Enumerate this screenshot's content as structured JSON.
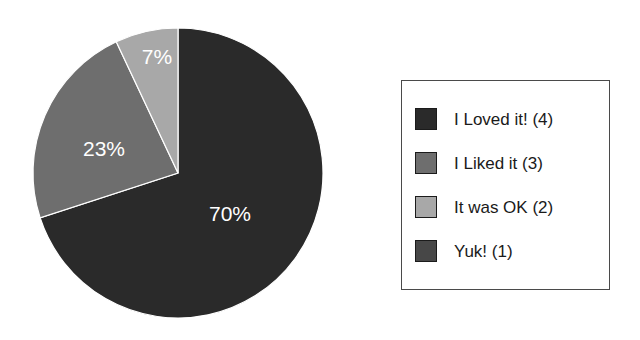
{
  "chart_data": {
    "type": "pie",
    "title": "",
    "categories": [
      "I Loved it! (4)",
      "I Liked it (3)",
      "It was OK (2)",
      "Yuk! (1)"
    ],
    "values": [
      70,
      23,
      7,
      0
    ],
    "value_labels": [
      "70%",
      "23%",
      "7%",
      ""
    ],
    "counts": [
      4,
      3,
      2,
      1
    ],
    "units": "percent",
    "start_angle_deg": 0,
    "direction": "clockwise",
    "legend_position": "right",
    "grid": false,
    "colors": [
      "#2a2a2a",
      "#6e6e6e",
      "#a8a8a8",
      "#474747"
    ],
    "label_color": "#ffffff",
    "background": "#ffffff"
  },
  "pie": {
    "slices": [
      {
        "label": "70%",
        "percent": 70,
        "color": "#2a2a2a",
        "label_x": 230,
        "label_y": 215
      },
      {
        "label": "23%",
        "percent": 23,
        "color": "#6e6e6e",
        "label_x": 104,
        "label_y": 150
      },
      {
        "label": "7%",
        "percent": 7,
        "color": "#a8a8a8",
        "label_x": 157,
        "label_y": 58
      },
      {
        "label": "",
        "percent": 0,
        "color": "#474747",
        "label_x": 0,
        "label_y": 0
      }
    ]
  },
  "legend": {
    "items": [
      {
        "label": "I Loved it! (4)",
        "color": "#2a2a2a"
      },
      {
        "label": "I Liked it (3)",
        "color": "#6e6e6e"
      },
      {
        "label": "It was OK (2)",
        "color": "#a8a8a8"
      },
      {
        "label": "Yuk! (1)",
        "color": "#474747"
      }
    ]
  }
}
